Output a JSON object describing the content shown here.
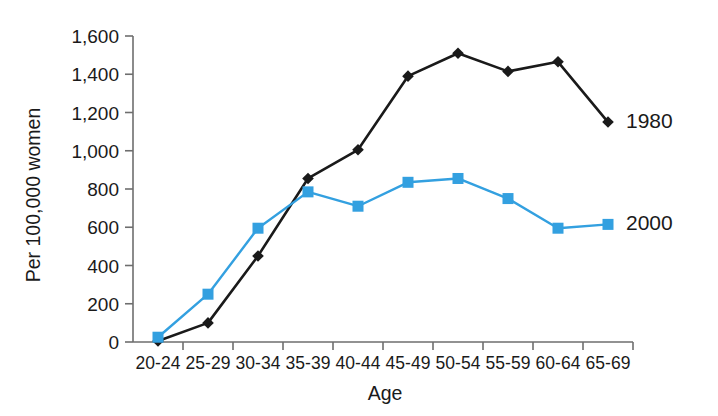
{
  "chart_data": {
    "type": "line",
    "title": "",
    "xlabel": "Age",
    "ylabel": "Per 100,000 women",
    "categories": [
      "20-24",
      "25-29",
      "30-34",
      "35-39",
      "40-44",
      "45-49",
      "50-54",
      "55-59",
      "60-64",
      "65-69"
    ],
    "ylim": [
      0,
      1600
    ],
    "yticks": [
      0,
      200,
      400,
      600,
      800,
      1000,
      1200,
      1400,
      1600
    ],
    "ytick_labels": [
      "0",
      "200",
      "400",
      "600",
      "800",
      "1,000",
      "1,200",
      "1,400",
      "1,600"
    ],
    "grid": false,
    "legend_position": "inline-right",
    "series": [
      {
        "name": "1980",
        "color": "#1a1a1a",
        "marker": "diamond",
        "values": [
          5,
          100,
          450,
          855,
          1005,
          1390,
          1510,
          1415,
          1465,
          1150
        ]
      },
      {
        "name": "2000",
        "color": "#33a0e0",
        "marker": "square",
        "values": [
          25,
          250,
          595,
          785,
          710,
          835,
          855,
          750,
          595,
          615
        ]
      }
    ]
  }
}
